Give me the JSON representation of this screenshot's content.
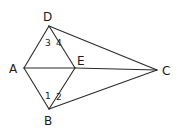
{
  "diagram": {
    "type": "geometry-figure",
    "stroke_color": "#2a2a2a",
    "points": {
      "A": {
        "label": "A",
        "x": 24,
        "y": 68
      },
      "B": {
        "label": "B",
        "x": 49,
        "y": 109
      },
      "C": {
        "label": "C",
        "x": 157,
        "y": 70
      },
      "D": {
        "label": "D",
        "x": 49,
        "y": 26
      },
      "E": {
        "label": "E",
        "x": 75,
        "y": 68
      }
    },
    "segments": [
      "AD",
      "AB",
      "AE",
      "EC",
      "DE",
      "BE",
      "DC",
      "BC"
    ],
    "angle_labels": {
      "a1": "1",
      "a2": "2",
      "a3": "3",
      "a4": "4"
    }
  }
}
